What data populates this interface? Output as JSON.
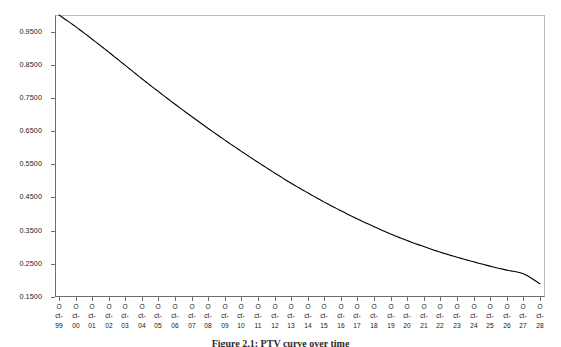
{
  "figure": {
    "caption": "Figure 2.1:  PTV curve over time",
    "background_color": "#ffffff",
    "frame_color": "#b9b9b9",
    "axis_color": "#6d6d6d",
    "curve_color": "#000000"
  },
  "chart_data": {
    "type": "line",
    "title": "",
    "subtitle": "",
    "xlabel": "",
    "ylabel": "",
    "grid": false,
    "legend": null,
    "ylim": [
      0.15,
      1.0
    ],
    "ytick_labels": [
      "0.9500",
      "0.8500",
      "0.7500",
      "0.6500",
      "0.5500",
      "0.4500",
      "0.3500",
      "0.2500",
      "0.1500"
    ],
    "ytick_values": [
      0.95,
      0.85,
      0.75,
      0.65,
      0.55,
      0.45,
      0.35,
      0.25,
      0.15
    ],
    "categories": [
      "Oct-99",
      "Oct-00",
      "Oct-01",
      "Oct-02",
      "Oct-03",
      "Oct-04",
      "Oct-05",
      "Oct-06",
      "Oct-07",
      "Oct-08",
      "Oct-09",
      "Oct-10",
      "Oct-11",
      "Oct-12",
      "Oct-13",
      "Oct-14",
      "Oct-15",
      "Oct-16",
      "Oct-17",
      "Oct-18",
      "Oct-19",
      "Oct-20",
      "Oct-21",
      "Oct-22",
      "Oct-23",
      "Oct-24",
      "Oct-25",
      "Oct-26",
      "Oct-27",
      "Oct-28"
    ],
    "xtick_label_lines": [
      [
        "O",
        "ct-",
        "99"
      ],
      [
        "O",
        "ct-",
        "00"
      ],
      [
        "O",
        "ct-",
        "01"
      ],
      [
        "O",
        "ct-",
        "02"
      ],
      [
        "O",
        "ct-",
        "03"
      ],
      [
        "O",
        "ct-",
        "04"
      ],
      [
        "O",
        "ct-",
        "05"
      ],
      [
        "O",
        "ct-",
        "06"
      ],
      [
        "O",
        "ct-",
        "07"
      ],
      [
        "O",
        "ct-",
        "08"
      ],
      [
        "O",
        "ct-",
        "09"
      ],
      [
        "O",
        "ct-",
        "10"
      ],
      [
        "O",
        "ct-",
        "11"
      ],
      [
        "O",
        "ct-",
        "12"
      ],
      [
        "O",
        "ct-",
        "13"
      ],
      [
        "O",
        "ct-",
        "14"
      ],
      [
        "O",
        "ct-",
        "15"
      ],
      [
        "O",
        "ct-",
        "16"
      ],
      [
        "O",
        "ct-",
        "17"
      ],
      [
        "O",
        "ct-",
        "18"
      ],
      [
        "O",
        "ct-",
        "19"
      ],
      [
        "O",
        "ct-",
        "20"
      ],
      [
        "O",
        "ct-",
        "21"
      ],
      [
        "O",
        "ct-",
        "22"
      ],
      [
        "O",
        "ct-",
        "23"
      ],
      [
        "O",
        "ct-",
        "24"
      ],
      [
        "O",
        "ct-",
        "25"
      ],
      [
        "O",
        "ct-",
        "26"
      ],
      [
        "O",
        "ct-",
        "27"
      ],
      [
        "O",
        "ct-",
        "28"
      ]
    ],
    "series": [
      {
        "name": "value",
        "values": [
          1.0,
          0.965,
          0.927,
          0.888,
          0.848,
          0.808,
          0.769,
          0.731,
          0.694,
          0.658,
          0.623,
          0.589,
          0.556,
          0.524,
          0.493,
          0.464,
          0.436,
          0.41,
          0.385,
          0.362,
          0.34,
          0.32,
          0.302,
          0.285,
          0.27,
          0.256,
          0.243,
          0.231,
          0.22,
          0.19
        ]
      }
    ]
  }
}
